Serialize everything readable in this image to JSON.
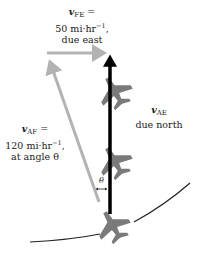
{
  "diagram": {
    "vectors": {
      "v_FE": {
        "symbol": "v",
        "subscript": "FE",
        "line1_suffix": " =",
        "value": "50 mi·hr",
        "exponent": "−1",
        "value_suffix": ",",
        "direction": "due east",
        "color": "#b3b3b3"
      },
      "v_AF": {
        "symbol": "v",
        "subscript": "AF",
        "line1_suffix": " =",
        "value": "120 mi·hr",
        "exponent": "−1",
        "value_suffix": ",",
        "direction": "at angle θ",
        "color": "#b3b3b3"
      },
      "v_AE": {
        "symbol": "v",
        "subscript": "AE",
        "direction": "due north",
        "color": "#000000"
      }
    },
    "angle_label": "θ",
    "plane_color": "#7a7a7a",
    "curve_color": "#222222"
  }
}
